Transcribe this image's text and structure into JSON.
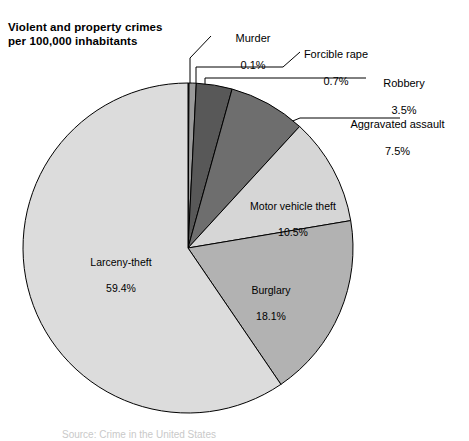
{
  "title": "Violent and property crimes\nper 100,000 inhabitants",
  "source_note": "Source: Crime in the United States",
  "colors": {
    "murder": "#8c8c8c",
    "forcible_rape": "#9a9a9a",
    "robbery": "#585858",
    "aggravated_assault": "#6e6e6e",
    "motor_vehicle_theft": "#d6d6d6",
    "burglary": "#b2b2b2",
    "larceny_theft": "#dcdcdc",
    "outline": "#000000",
    "background": "#ffffff",
    "text": "#000000"
  },
  "callouts": [
    {
      "name": "Murder",
      "pct": "0.1%",
      "align": "align-center"
    },
    {
      "name": "Forcible rape",
      "pct": "0.7%",
      "align": "align-center"
    },
    {
      "name": "Robbery",
      "pct": "3.5%",
      "align": "align-center"
    },
    {
      "name": "Aggravated assault",
      "pct": "7.5%",
      "align": "align-center"
    }
  ],
  "slice_labels": [
    {
      "name": "Motor vehicle theft",
      "pct": "10.5%"
    },
    {
      "name": "Burglary",
      "pct": "18.1%"
    },
    {
      "name": "Larceny-theft",
      "pct": "59.4%"
    }
  ],
  "chart_data": {
    "type": "pie",
    "title": "Violent and property crimes per 100,000 inhabitants",
    "unit": "percent",
    "total": 99.8,
    "legend": "none",
    "labels_inside": [
      "Motor vehicle theft",
      "Burglary",
      "Larceny-theft"
    ],
    "labels_callout": [
      "Murder",
      "Forcible rape",
      "Robbery",
      "Aggravated assault"
    ],
    "start_angle_deg": 0,
    "direction": "clockwise",
    "categories": [
      "Murder",
      "Forcible rape",
      "Robbery",
      "Aggravated assault",
      "Motor vehicle theft",
      "Burglary",
      "Larceny-theft"
    ],
    "values": [
      0.1,
      0.7,
      3.5,
      7.5,
      10.5,
      18.1,
      59.4
    ],
    "slices": [
      {
        "label": "Murder",
        "value": 0.1,
        "color": "#8c8c8c"
      },
      {
        "label": "Forcible rape",
        "value": 0.7,
        "color": "#9a9a9a"
      },
      {
        "label": "Robbery",
        "value": 3.5,
        "color": "#585858"
      },
      {
        "label": "Aggravated assault",
        "value": 7.5,
        "color": "#6e6e6e"
      },
      {
        "label": "Motor vehicle theft",
        "value": 10.5,
        "color": "#d6d6d6"
      },
      {
        "label": "Burglary",
        "value": 18.1,
        "color": "#b2b2b2"
      },
      {
        "label": "Larceny-theft",
        "value": 59.4,
        "color": "#dcdcdc"
      }
    ]
  },
  "geometry": {
    "cx": 188,
    "cy": 248,
    "r": 165
  }
}
